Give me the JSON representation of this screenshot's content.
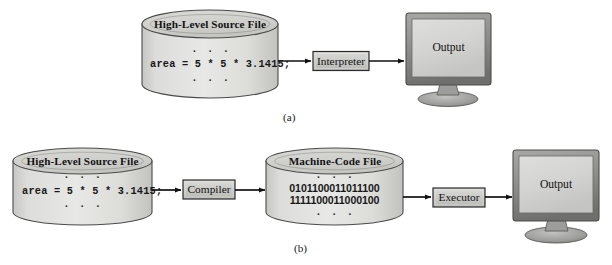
{
  "figure": {
    "captions": [
      {
        "id": "caption-a",
        "text": "(a)",
        "x": 288,
        "y": 112
      },
      {
        "id": "caption-b",
        "text": "(b)",
        "x": 299,
        "y": 243
      }
    ]
  },
  "colors": {
    "cylinder_face": "#dededc",
    "cylinder_top": "#d2d2cf",
    "cylinder_stroke": "#4a4a4a",
    "box_fill": "#c9c9c6",
    "box_stroke": "#2b2b2b",
    "monitor_bezel": "#8f8f8f",
    "monitor_screen": "#d6d6d4",
    "monitor_stand": "#9a9a9a",
    "arrow": "#111111",
    "text": "#141414",
    "page_background": "#ffffff"
  },
  "diagram_a": {
    "name": "interpreter-flow",
    "source_file": {
      "title": "High-Level Source File",
      "dots_top": "· · ·",
      "code_line": "area = 5 * 5 * 3.1415;",
      "dots_bottom": "· · ·"
    },
    "process_box": {
      "label": "Interpreter"
    },
    "monitor": {
      "label": "Output"
    },
    "arrows": [
      {
        "name": "arrow-source-to-interpreter",
        "from": "source_file",
        "to": "process_box"
      },
      {
        "name": "arrow-interpreter-to-output",
        "from": "process_box",
        "to": "monitor"
      }
    ]
  },
  "diagram_b": {
    "name": "compiler-flow",
    "source_file": {
      "title": "High-Level Source File",
      "dots_top": "· · ·",
      "code_line": "area = 5 * 5 * 3.1415;",
      "dots_bottom": "· · ·"
    },
    "compiler_box": {
      "label": "Compiler"
    },
    "machine_file": {
      "title": "Machine-Code File",
      "dots_top": "· · ·",
      "binary_lines": [
        "0101100011011100",
        "1111100011000100"
      ],
      "dots_bottom": "· · ·"
    },
    "executor_box": {
      "label": "Executor"
    },
    "monitor": {
      "label": "Output"
    },
    "arrows": [
      {
        "name": "arrow-source-to-compiler",
        "from": "source_file",
        "to": "compiler_box"
      },
      {
        "name": "arrow-compiler-to-machinefile",
        "from": "compiler_box",
        "to": "machine_file"
      },
      {
        "name": "arrow-machinefile-to-executor",
        "from": "machine_file",
        "to": "executor_box"
      },
      {
        "name": "arrow-executor-to-output",
        "from": "executor_box",
        "to": "monitor"
      }
    ]
  }
}
